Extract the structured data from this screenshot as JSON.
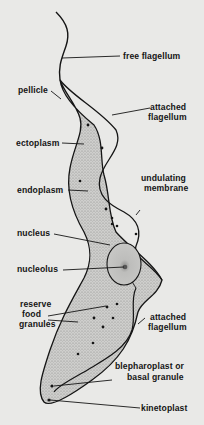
{
  "diagram": {
    "colors": {
      "background": "#e9e9e7",
      "ink": "#151515",
      "cytoplasm": "#b8b8b6"
    },
    "labels": {
      "free_flagellum": "free flagellum",
      "pellicle": "pellicle",
      "attached_flagellum_top_1": "attached",
      "attached_flagellum_top_2": "flagellum",
      "ectoplasm": "ectoplasm",
      "endoplasm": "endoplasm",
      "undulating_membrane_1": "undulating",
      "undulating_membrane_2": "membrane",
      "nucleus": "nucleus",
      "nucleolus": "nucleolus",
      "reserve_food_granules_1": "reserve",
      "reserve_food_granules_2": "food",
      "reserve_food_granules_3": "granules",
      "attached_flagellum_bottom_1": "attached",
      "attached_flagellum_bottom_2": "flagellum",
      "blepharoplast_1": "blepharoplast or",
      "blepharoplast_2": "basal granule",
      "kinetoplast": "kinetoplast"
    }
  }
}
